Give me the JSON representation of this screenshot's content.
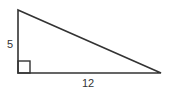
{
  "diagram": {
    "type": "right-triangle",
    "labels": {
      "vertical_leg": "5",
      "horizontal_leg": "12"
    },
    "right_angle_marker": true,
    "stroke_color": "#333333"
  }
}
